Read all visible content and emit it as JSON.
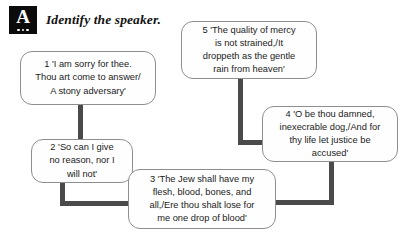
{
  "header": {
    "icon": "answer-badge-icon",
    "badge_letter": "A",
    "title": "Identify the speaker."
  },
  "colors": {
    "badge_background": "#0b0b0b",
    "badge_foreground": "#ffffff",
    "box_border": "#8e8e8e",
    "box_fill": "#fefefe",
    "connector": "#4a4a4a",
    "text": "#1b1b1b",
    "page_background": "#ffffff"
  },
  "diagram": {
    "type": "flow-diagram",
    "boxes": [
      {
        "id": "1",
        "number": "1",
        "text": "1 'I am sorry for thee. Thou art come to answer/ A stony adversary'",
        "lines": [
          "1 'I am sorry for thee.",
          "Thou art come to answer/",
          "A stony adversary'"
        ]
      },
      {
        "id": "2",
        "number": "2",
        "text": "2 'So can I give no reason, nor I will not'",
        "lines": [
          "2 'So can I give",
          "no reason, nor I",
          "will not'"
        ]
      },
      {
        "id": "3",
        "number": "3",
        "text": "3 'The Jew shall have my flesh, blood, bones, and all,/Ere thou shalt lose for me one drop of blood'",
        "lines": [
          "3 'The Jew shall have my",
          "flesh, blood, bones, and",
          "all,/Ere thou shalt lose for",
          "me one drop of blood'"
        ]
      },
      {
        "id": "4",
        "number": "4",
        "text": "4 'O be thou damned, inexecrable dog,/And for thy life let justice be accused'",
        "lines": [
          "4 'O be thou damned,",
          "inexecrable dog,/And for",
          "thy life let justice be",
          "accused'"
        ]
      },
      {
        "id": "5",
        "number": "5",
        "text": "5 'The quality of mercy is not strained,/It droppeth as the gentle rain from heaven'",
        "lines": [
          "5 'The quality of mercy",
          "is not strained,/It",
          "droppeth as the gentle",
          "rain from heaven'"
        ]
      }
    ],
    "connectors": [
      {
        "from": "1",
        "to": "2",
        "shape": "vertical"
      },
      {
        "from": "2",
        "to": "3",
        "shape": "elbow-down-right"
      },
      {
        "from": "5",
        "to": "4",
        "shape": "elbow-down-right"
      },
      {
        "from": "3",
        "to": "4",
        "shape": "elbow-right-up"
      }
    ]
  }
}
